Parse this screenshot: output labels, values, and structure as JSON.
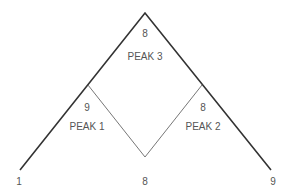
{
  "diagram": {
    "peaks": [
      {
        "name": "PEAK 3",
        "value": "8"
      },
      {
        "name": "PEAK 1",
        "value": "9"
      },
      {
        "name": "PEAK 2",
        "value": "8"
      }
    ],
    "base_labels": {
      "left": "1",
      "center": "8",
      "right": "9"
    },
    "colors": {
      "outer_line": "#333333",
      "inner_line": "#777777",
      "text": "#555555"
    }
  }
}
